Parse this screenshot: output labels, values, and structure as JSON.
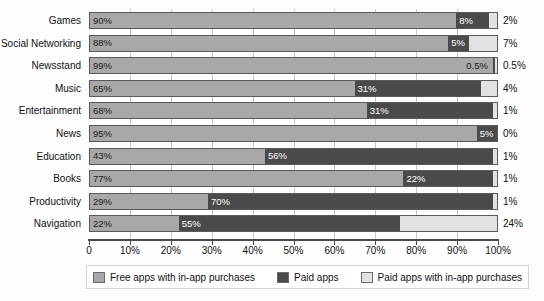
{
  "chart_data": {
    "type": "bar",
    "subtype": "stacked-horizontal-100",
    "title": "",
    "xlabel": "",
    "ylabel": "",
    "xlim": [
      0,
      100
    ],
    "grid": true,
    "legend_position": "bottom",
    "categories": [
      "Games",
      "Social Networking",
      "Newsstand",
      "Music",
      "Entertainment",
      "News",
      "Education",
      "Books",
      "Productivity",
      "Navigation"
    ],
    "series": [
      {
        "name": "Free apps with in-app purchases",
        "color": "#a8a8a8",
        "values": [
          90,
          88,
          99,
          65,
          68,
          95,
          43,
          77,
          29,
          22
        ],
        "labels": [
          "90%",
          "88%",
          "99%",
          "65%",
          "68%",
          "95%",
          "43%",
          "77%",
          "29%",
          "22%"
        ]
      },
      {
        "name": "Paid apps",
        "color": "#4a4a4a",
        "values": [
          8,
          5,
          0.5,
          31,
          31,
          5,
          56,
          22,
          70,
          55
        ],
        "labels": [
          "8%",
          "5%",
          "0.5%",
          "31%",
          "31%",
          "5%",
          "56%",
          "22%",
          "70%",
          "55%"
        ]
      },
      {
        "name": "Paid apps with in-app purchases",
        "color": "#e2e2e2",
        "values": [
          2,
          7,
          0.5,
          4,
          1,
          0,
          1,
          1,
          1,
          24
        ],
        "labels": [
          "2%",
          "7%",
          "0.5%",
          "4%",
          "1%",
          "0%",
          "1%",
          "1%",
          "1%",
          "24%"
        ]
      }
    ],
    "x_ticks": [
      0,
      10,
      20,
      30,
      40,
      50,
      60,
      70,
      80,
      90,
      100
    ],
    "x_tick_labels": [
      "0",
      "10%",
      "20%",
      "30%",
      "40%",
      "50%",
      "60%",
      "70%",
      "80%",
      "90%",
      "100%"
    ],
    "right_axis_labels": [
      "2%",
      "7%",
      "0.5%",
      "4%",
      "1%",
      "0%",
      "1%",
      "1%",
      "1%",
      "24%"
    ]
  },
  "legend": {
    "items": [
      {
        "label": "Free apps with in-app purchases",
        "color": "#a8a8a8"
      },
      {
        "label": "Paid apps",
        "color": "#4a4a4a"
      },
      {
        "label": "Paid apps with in-app purchases",
        "color": "#e2e2e2"
      }
    ]
  },
  "colors": {
    "free": "#a8a8a8",
    "paid": "#4a4a4a",
    "paid_iap": "#e2e2e2",
    "background": "#fdfdfd",
    "axis": "#4a4a4a",
    "grid": "#c9c9c9",
    "text": "#111111"
  }
}
